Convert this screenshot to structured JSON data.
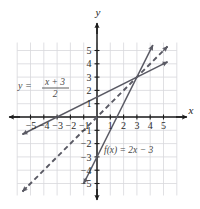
{
  "figure": {
    "kind": "cartesian-coordinate-plane",
    "axis_labels": {
      "x": "x",
      "y": "y"
    },
    "colors": {
      "grid": "#d8d8dc",
      "axis": "#1c1c1c",
      "curve": "#5a5a64",
      "label_text": "#4a4a4a",
      "tick_text": "#2b2b2b",
      "background": "#ffffff"
    },
    "labels": [
      {
        "name": "line-label-y",
        "text": "y =",
        "numerator": "x + 3",
        "denominator": "2"
      },
      {
        "name": "line-label-f",
        "text": "f(x) = 2x − 3"
      }
    ]
  },
  "chart_data": {
    "type": "line",
    "title": "",
    "xlabel": "x",
    "ylabel": "y",
    "xlim": [
      -6,
      6
    ],
    "ylim": [
      -6,
      6
    ],
    "grid": true,
    "legend": "none",
    "xticks": [
      -5,
      -4,
      -3,
      -2,
      -1,
      1,
      2,
      3,
      4,
      5
    ],
    "yticks": [
      -5,
      -4,
      -3,
      -2,
      -1,
      1,
      2,
      3,
      4,
      5
    ],
    "xtick_labels": [
      "-5",
      "-4",
      "-3",
      "-2",
      "-1",
      "1",
      "2",
      "3",
      "4",
      "5"
    ],
    "ytick_labels": [
      "-5",
      "-4",
      "-3",
      "-2",
      "-1",
      "1",
      "2",
      "3",
      "4",
      "5"
    ],
    "series": [
      {
        "name": "f(x) = 2x - 3",
        "label": "f(x) = 2x − 3",
        "style": "solid",
        "slope": 2,
        "intercept": -3,
        "x": [
          -1,
          4.2
        ],
        "y": [
          -5,
          5.4
        ],
        "arrows": "both"
      },
      {
        "name": "y = (x+3)/2",
        "label": "y = (x + 3) / 2",
        "style": "solid",
        "slope": 0.5,
        "intercept": 1.5,
        "x": [
          -5.6,
          5.3
        ],
        "y": [
          -1.3,
          4.15
        ],
        "arrows": "both"
      },
      {
        "name": "y = x",
        "label": "y = x",
        "style": "dashed",
        "slope": 1,
        "intercept": 0,
        "x": [
          -5.6,
          5.3
        ],
        "y": [
          -5.6,
          5.3
        ],
        "arrows": "both"
      }
    ],
    "annotations": [
      {
        "name": "intersection-point",
        "x": 3,
        "y": 3,
        "text": ""
      }
    ]
  }
}
